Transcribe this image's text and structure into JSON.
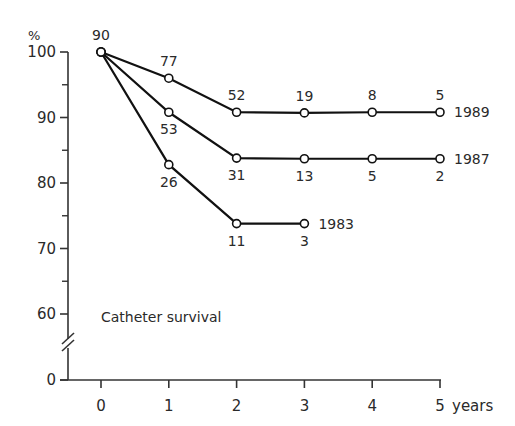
{
  "chart_data": {
    "type": "line",
    "title": "Catheter survival",
    "xlabel": "years",
    "ylabel": "%",
    "x": [
      0,
      1,
      2,
      3,
      4,
      5
    ],
    "xticks": [
      "0",
      "1",
      "2",
      "3",
      "4",
      "5"
    ],
    "yticks": [
      "0",
      "60",
      "70",
      "80",
      "90",
      "100"
    ],
    "ylim": [
      0,
      100
    ],
    "axis_break": "between 0 and 60",
    "grid": false,
    "legend_position": "inline labels at line ends",
    "series": [
      {
        "name": "1989",
        "x": [
          0,
          1,
          2,
          3,
          4,
          5
        ],
        "values": [
          100,
          96,
          90.8,
          90.7,
          90.8,
          90.8
        ],
        "n_at_risk": [
          "90",
          "77",
          "52",
          "19",
          "8",
          "5"
        ]
      },
      {
        "name": "1987",
        "x": [
          0,
          1,
          2,
          3,
          4,
          5
        ],
        "values": [
          100,
          90.8,
          83.8,
          83.7,
          83.7,
          83.7
        ],
        "n_at_risk": [
          "90",
          "53",
          "31",
          "13",
          "5",
          "2"
        ]
      },
      {
        "name": "1983",
        "x": [
          0,
          1,
          2,
          3
        ],
        "values": [
          100,
          82.8,
          73.8,
          73.8
        ],
        "n_at_risk": [
          "90",
          "26",
          "11",
          "3"
        ]
      }
    ]
  }
}
